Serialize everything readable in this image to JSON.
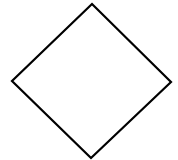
{
  "diagram": {
    "shape": "diamond",
    "stroke_color": "#000000",
    "fill_color": "#ffffff",
    "stroke_width": 2.2,
    "vertices": {
      "top": [
        92,
        4
      ],
      "right": [
        171,
        82
      ],
      "bottom": [
        91,
        158
      ],
      "left": [
        12,
        81
      ]
    }
  }
}
